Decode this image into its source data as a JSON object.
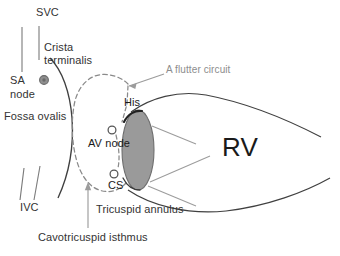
{
  "figure": {
    "type": "anatomical-diagram",
    "background_color": "#ffffff"
  },
  "colors": {
    "outline": "#404040",
    "vessel_line": "#7a7a7a",
    "dashed_circuit": "#8a8a8a",
    "annulus_fill": "#9a9a9a",
    "annulus_stroke": "#6e6e6e",
    "leader_line": "#9c9c9c",
    "label_dark": "#333333",
    "label_grey": "#8d8d8d",
    "label_black": "#1a1a1a",
    "sa_node_fill": "#8f8f8f"
  },
  "labels": {
    "svc": "SVC",
    "crista_terminalis_line1": "Crista",
    "crista_terminalis_line2": "terminalis",
    "sa_node_line1": "SA",
    "sa_node_line2": "node",
    "fossa_ovalis": "Fossa ovalis",
    "ivc": "IVC",
    "a_flutter_circuit": "A flutter circuit",
    "his": "His",
    "av_node": "AV node",
    "cs": "CS",
    "rv": "RV",
    "tricuspid_annulus": "Tricuspid annulus",
    "cavotricuspid_isthmus": "Cavotricuspid isthmus"
  },
  "markers": {
    "sa_node_icon": "filled-circle",
    "av_node_icon": "open-circle",
    "cs_icon": "open-circle"
  },
  "annotations": [
    {
      "name": "a-flutter-arrow",
      "label": "A flutter circuit",
      "points_to": "dashed circuit loop",
      "style": "grey arrow"
    },
    {
      "name": "cavotricuspid-isthmus-arrow",
      "label": "Cavotricuspid isthmus",
      "points_to": "inferior dashed isthmus segment",
      "style": "grey arrow pointing up"
    },
    {
      "name": "tricuspid-annulus-leader-upper",
      "label": "Tricuspid annulus",
      "points_to": "tricuspid annulus ellipse upper region",
      "style": "grey leader line"
    },
    {
      "name": "tricuspid-annulus-leader-lower",
      "label": "Tricuspid annulus",
      "points_to": "tricuspid annulus ellipse lower region",
      "style": "grey leader line"
    }
  ]
}
